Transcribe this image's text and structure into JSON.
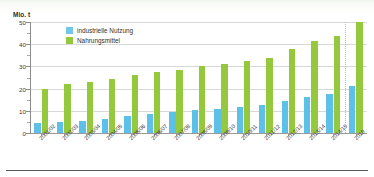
{
  "chart_data": {
    "type": "bar",
    "title": "",
    "xlabel": "",
    "ylabel": "Mio. t",
    "ylim": [
      0,
      50
    ],
    "yticks": [
      0,
      10,
      20,
      30,
      40,
      50
    ],
    "ytick_labels": [
      "0",
      "10",
      "20",
      "30",
      "40",
      "50"
    ],
    "yminor_step": 5,
    "grid": true,
    "legend_position": "top-left",
    "categories": [
      "2001/02",
      "2002/03",
      "2003/04",
      "2004/05",
      "2005/06",
      "2006/07",
      "2007/08",
      "2008/09",
      "2009/10",
      "2010/11",
      "2011/12",
      "2012/13",
      "2013/14",
      "2014/15",
      "2019"
    ],
    "series": [
      {
        "name": "industrielle Nutzung",
        "color": "#5dc1e7",
        "values": [
          4.5,
          5.0,
          5.5,
          6.5,
          7.5,
          8.5,
          9.5,
          10.5,
          11.0,
          11.5,
          12.5,
          14.5,
          16.0,
          17.5,
          21.0
        ]
      },
      {
        "name": "Nahrungsmittel",
        "color": "#95c93d",
        "values": [
          20.0,
          22.0,
          23.0,
          24.5,
          26.0,
          27.5,
          28.5,
          30.0,
          31.0,
          32.5,
          34.0,
          38.0,
          41.5,
          43.5,
          50.0
        ]
      }
    ]
  },
  "legend": {
    "items": [
      {
        "label": "industrielle Nutzung",
        "color": "#72c7e8"
      },
      {
        "label": "Nahrungsmittel",
        "color": "#95c93d"
      }
    ]
  },
  "axis": {
    "y_title": "Mio. t"
  }
}
